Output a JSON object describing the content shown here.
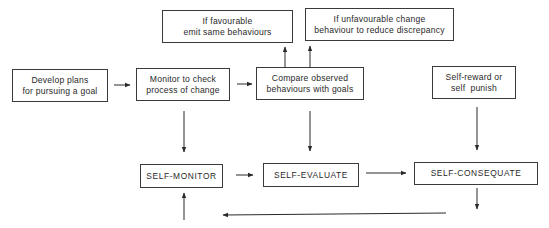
{
  "diagram": {
    "title": "",
    "nodes": {
      "develop_plans": {
        "line1": "Develop plans",
        "line2": "for pursuing a goal"
      },
      "monitor_check": {
        "line1": "Monitor to check",
        "line2": "process of change"
      },
      "compare_observed": {
        "line1": "Compare observed",
        "line2": "behaviours with goals"
      },
      "self_reward": {
        "line1": "Self-reward or",
        "line2": "self  punish"
      },
      "if_favourable": {
        "line1": "If favourable",
        "line2": "emit same behaviours"
      },
      "if_unfavourable": {
        "line1": "If unfavourable change",
        "line2": "behaviour to reduce discrepancy"
      },
      "self_monitor": {
        "label": "SELF-MONITOR"
      },
      "self_evaluate": {
        "label": "SELF-EVALUATE"
      },
      "self_consequate": {
        "label": "SELF-CONSEQUATE"
      }
    },
    "edges": [
      {
        "from": "develop_plans",
        "to": "monitor_check"
      },
      {
        "from": "monitor_check",
        "to": "compare_observed"
      },
      {
        "from": "compare_observed",
        "to": "if_favourable"
      },
      {
        "from": "compare_observed",
        "to": "if_unfavourable"
      },
      {
        "from": "monitor_check",
        "to": "self_monitor"
      },
      {
        "from": "compare_observed",
        "to": "self_evaluate"
      },
      {
        "from": "self_reward",
        "to": "self_consequate"
      },
      {
        "from": "self_monitor",
        "to": "self_evaluate"
      },
      {
        "from": "self_evaluate",
        "to": "self_consequate"
      },
      {
        "from": "self_consequate",
        "to": "self_monitor",
        "note": "feedback loop"
      }
    ],
    "colors": {
      "line": "#2a2a2a",
      "background": "#ffffff"
    }
  }
}
